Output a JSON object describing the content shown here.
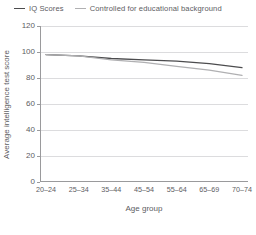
{
  "chart_data": {
    "type": "line",
    "title": "",
    "xlabel": "Age group",
    "ylabel": "Average intelligence test score",
    "categories": [
      "20–24",
      "25–34",
      "35–44",
      "45–54",
      "55–64",
      "65–69",
      "70–74"
    ],
    "yticks": [
      0,
      20,
      40,
      60,
      80,
      100,
      120
    ],
    "ylim": [
      0,
      120
    ],
    "grid": true,
    "legend_position": "top-left",
    "series": [
      {
        "name": "IQ Scores",
        "color": "#4c4c4e",
        "values": [
          98,
          97,
          95,
          94,
          93,
          91,
          88
        ]
      },
      {
        "name": "Controlled for educational background",
        "color": "#b0b0b2",
        "values": [
          98,
          97,
          94,
          92,
          89,
          86,
          82
        ]
      }
    ]
  }
}
